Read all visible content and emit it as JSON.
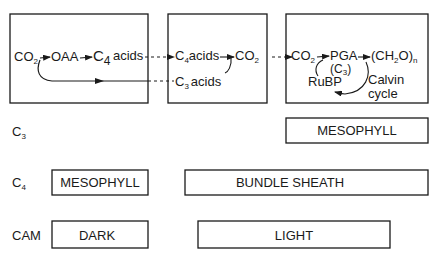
{
  "diagram": {
    "box1": {
      "co2": "CO",
      "co2_sub": "2",
      "oaa": "OAA",
      "c4": "C",
      "c4_sub": "4",
      "acids": "acids"
    },
    "box2": {
      "c4acids_c": "C",
      "c4acids_sub": "4",
      "c4acids_word": "acids",
      "co2": "CO",
      "co2_sub": "2",
      "c3_c": "C",
      "c3_sub": "3",
      "c3_word": "acids"
    },
    "box3": {
      "co2": "CO",
      "co2_sub": "2",
      "pga": "PGA",
      "c3_label": "(C",
      "c3_sub": "3",
      "c3_close": ")",
      "ch2o_open": "(CH",
      "ch2o_sub": "2",
      "ch2o_close": "O)",
      "ch2o_n": "n",
      "rubp": "RuBP",
      "calvin_line1": "Calvin",
      "calvin_line2": "cycle"
    },
    "rows": [
      {
        "label": "C",
        "label_sub": "3",
        "boxes": [
          {
            "text": "MESOPHYLL"
          }
        ]
      },
      {
        "label": "C",
        "label_sub": "4",
        "boxes": [
          {
            "text": "MESOPHYLL"
          },
          {
            "text": "BUNDLE SHEATH"
          }
        ]
      },
      {
        "label": "CAM",
        "label_sub": "",
        "boxes": [
          {
            "text": "DARK"
          },
          {
            "text": "LIGHT"
          }
        ]
      }
    ]
  }
}
